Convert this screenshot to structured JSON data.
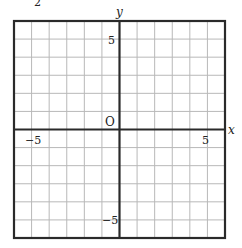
{
  "figure": {
    "type": "coordinate-grid",
    "corner_fragment": "2",
    "axes": {
      "x_label": "x",
      "y_label": "y",
      "origin_label": "O"
    },
    "ticks": {
      "x_neg": "−5",
      "x_pos": "5",
      "y_pos": "5",
      "y_neg": "−5"
    },
    "grid": {
      "x_range": [
        -6,
        6
      ],
      "y_range": [
        -6,
        6
      ],
      "step": 1
    },
    "colors": {
      "grid_line": "#b8b8b8",
      "frame": "#2a2a2a",
      "axis": "#2a2a2a",
      "text": "#222222"
    }
  },
  "chart_data": {
    "type": "coordinate-grid",
    "title": "",
    "xlabel": "x",
    "ylabel": "y",
    "xlim": [
      -6,
      6
    ],
    "ylim": [
      -6,
      6
    ],
    "grid": true,
    "tick_labels": {
      "x": [
        -5,
        5
      ],
      "y": [
        -5,
        5
      ]
    },
    "origin": "O",
    "series": []
  }
}
